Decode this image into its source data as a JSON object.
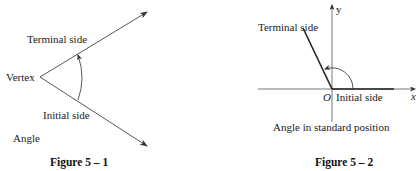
{
  "figures": [
    {
      "id": "fig1",
      "caption": "Figure 5 – 1",
      "labels": {
        "terminal_side": "Terminal side",
        "vertex": "Vertex",
        "initial_side": "Initial side",
        "angle": "Angle"
      }
    },
    {
      "id": "fig2",
      "caption": "Figure 5 – 2",
      "labels": {
        "terminal_side": "Terminal side",
        "y_axis": "y",
        "x_axis": "x",
        "origin": "O",
        "initial_side": "Initial side",
        "subtitle": "Angle in standard position"
      }
    }
  ],
  "colors": {
    "line": "#333333",
    "text": "#222222",
    "background": "#ffffff"
  }
}
